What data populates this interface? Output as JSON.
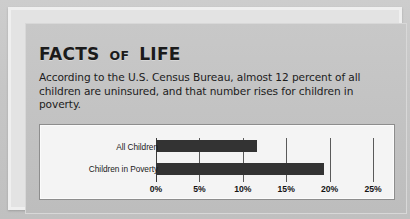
{
  "callout": {
    "heading_main": "FACTS",
    "heading_connector": "OF",
    "heading_tail": "LIFE",
    "body": "According to the U.S. Census Bureau, almost 12 percent of all children are uninsured, and that number rises for children in poverty."
  },
  "chart_data": {
    "type": "bar",
    "orientation": "horizontal",
    "title": "",
    "xlabel": "",
    "ylabel": "",
    "categories": [
      "All Children",
      "Children in Poverty"
    ],
    "values": [
      11.6,
      19.4
    ],
    "unit": "%",
    "xlim": [
      0,
      25
    ],
    "xticks": [
      0,
      5,
      10,
      15,
      20,
      25
    ],
    "xtick_labels": [
      "0%",
      "5%",
      "10%",
      "15%",
      "20%",
      "25%"
    ],
    "grid": true,
    "legend": false,
    "bar_color": "#333333",
    "plot_background": "#f4f4f4"
  },
  "colors": {
    "callout_background": "#c4c4c4",
    "page_background": "#c9c9c9",
    "text": "#1b1b1b",
    "panel_border": "#8d8d8d"
  }
}
